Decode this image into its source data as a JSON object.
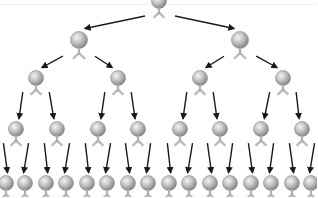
{
  "diagram": {
    "type": "binary-tree",
    "levels": 5,
    "colors": {
      "background": "#ffffff",
      "arrow": "#1a1a1a",
      "sphere_light": "#eeeeee",
      "sphere_mid": "#b8b8b8",
      "sphere_dark": "#7a7a7a",
      "stem": "#b0b0b0"
    },
    "node_icon": "antibody-sphere-icon",
    "rows": [
      {
        "level": 0,
        "y": 1,
        "r": 7.5,
        "xs": [
          159
        ]
      },
      {
        "level": 1,
        "y": 40,
        "r": 8.5,
        "xs": [
          79,
          240
        ]
      },
      {
        "level": 2,
        "y": 78,
        "r": 7.5,
        "xs": [
          36,
          118,
          200,
          283
        ]
      },
      {
        "level": 3,
        "y": 129,
        "r": 7.5,
        "xs": [
          16,
          57,
          98,
          138,
          180,
          220,
          261,
          302
        ]
      },
      {
        "level": 4,
        "y": 183,
        "r": 7.5,
        "xs": [
          6,
          25,
          46,
          66,
          87,
          107,
          128,
          148,
          169,
          189,
          210,
          230,
          251,
          271,
          292,
          311
        ]
      }
    ],
    "node_count": 31,
    "arrow_count": 30
  }
}
